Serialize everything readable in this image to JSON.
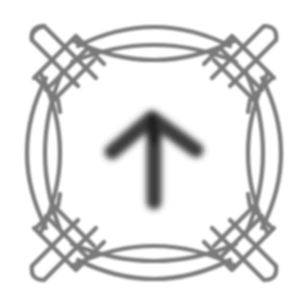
{
  "icon": {
    "name": "upload-arrow-knot-frame",
    "symbol": "arrow-up",
    "frame": "celtic-knot-border",
    "colors": {
      "background": "#ffffff",
      "frame_stroke": "#7a7a7a",
      "arrow": "#3a3a3a"
    }
  }
}
